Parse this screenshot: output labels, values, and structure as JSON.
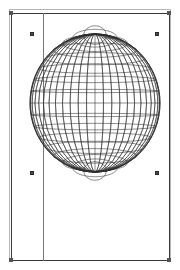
{
  "canvas": {
    "width": 180,
    "height": 270,
    "background": "#ffffff",
    "page_border_color": "#3a3a3a",
    "shadow_border_color": "#b5b5b5",
    "guide_color": "#777777",
    "handle_fill": "#4a4a4a",
    "handle_stroke": "#2b2b2b"
  },
  "page": {
    "label": "page-rectangle",
    "x": 11,
    "y": 13,
    "width": 159,
    "height": 248
  },
  "guide": {
    "label": "vertical-guide",
    "x": 43,
    "y_top": 13,
    "y_bottom": 261
  },
  "handles": [
    {
      "name": "handle-top-left",
      "x": 30,
      "y": 32
    },
    {
      "name": "handle-top-right",
      "x": 155,
      "y": 32
    },
    {
      "name": "handle-bottom-left",
      "x": 30,
      "y": 171
    },
    {
      "name": "handle-bottom-right",
      "x": 155,
      "y": 171
    }
  ],
  "frame_nubs": [
    {
      "name": "nub-top-left",
      "x": 9,
      "y": 11
    },
    {
      "name": "nub-top-right",
      "x": 167,
      "y": 11
    },
    {
      "name": "nub-bottom-left",
      "x": 9,
      "y": 258
    },
    {
      "name": "nub-bottom-right",
      "x": 167,
      "y": 258
    }
  ],
  "globe": {
    "label": "wireframe-sphere",
    "center_x": 95,
    "center_y": 103,
    "radius_x": 65,
    "radius_y": 69,
    "meridian_count": 24,
    "parallel_count": 17,
    "stroke_color": "#2e2e2e",
    "stroke_width": 0.55,
    "outline_width": 0.9
  }
}
